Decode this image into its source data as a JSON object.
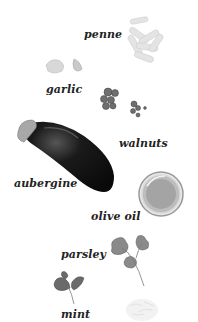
{
  "ingredients": [
    {
      "name": "penne",
      "label": "penne",
      "icon": "penne-pasta-icon"
    },
    {
      "name": "garlic",
      "label": "garlic",
      "icon": "garlic-icon"
    },
    {
      "name": "walnuts",
      "label": "walnuts",
      "icon": "walnuts-icon"
    },
    {
      "name": "aubergine",
      "label": "aubergine",
      "icon": "aubergine-icon"
    },
    {
      "name": "olive oil",
      "label": "olive oil",
      "icon": "olive-oil-dish-icon"
    },
    {
      "name": "parsley",
      "label": "parsley",
      "icon": "parsley-icon"
    },
    {
      "name": "mint",
      "label": "mint",
      "icon": "mint-icon"
    },
    {
      "name": "parmesan",
      "label": "",
      "icon": "grated-cheese-icon"
    }
  ]
}
